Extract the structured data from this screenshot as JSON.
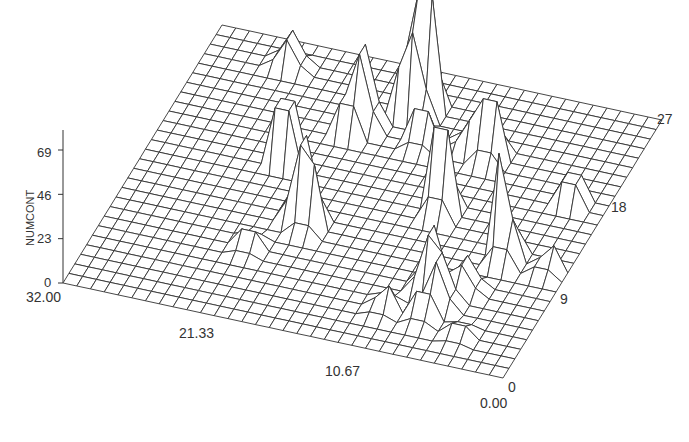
{
  "chart_data": {
    "type": "surface3d",
    "title": "",
    "zlabel": "NUMCONT",
    "z_ticks": [
      "0",
      "23",
      "46",
      "69"
    ],
    "y_ticks": [
      "32.00",
      "21.33",
      "10.67",
      "0.00"
    ],
    "x_ticks": [
      "0",
      "9",
      "18",
      "27"
    ],
    "zlim": [
      0,
      69
    ],
    "ylim": [
      0,
      32
    ],
    "xlim": [
      0,
      27
    ],
    "grid": {
      "nu": 32,
      "nv": 27
    },
    "peaks": [
      {
        "u": 16.5,
        "v": 23.0,
        "z": 105
      },
      {
        "u": 15.8,
        "v": 22.5,
        "z": 78
      },
      {
        "u": 13.0,
        "v": 20.5,
        "z": 68
      },
      {
        "u": 12.5,
        "v": 19.5,
        "z": 30
      },
      {
        "u": 21.5,
        "v": 14.0,
        "z": 75
      },
      {
        "u": 22.5,
        "v": 20.0,
        "z": 52
      },
      {
        "u": 21.0,
        "v": 20.5,
        "z": 30
      },
      {
        "u": 17.5,
        "v": 20.0,
        "z": 30
      },
      {
        "u": 6.0,
        "v": 24.5,
        "z": 28
      },
      {
        "u": 9.5,
        "v": 15.5,
        "z": 52
      },
      {
        "u": 13.0,
        "v": 10.5,
        "z": 72
      },
      {
        "u": 13.8,
        "v": 10.0,
        "z": 40
      },
      {
        "u": 10.5,
        "v": 7.0,
        "z": 15
      },
      {
        "u": 27.2,
        "v": 11.0,
        "z": 65
      },
      {
        "u": 24.0,
        "v": 6.5,
        "z": 55
      },
      {
        "u": 25.0,
        "v": 5.5,
        "z": 42
      },
      {
        "u": 24.5,
        "v": 4.0,
        "z": 22
      },
      {
        "u": 26.0,
        "v": 7.5,
        "z": 25
      },
      {
        "u": 29.5,
        "v": 17.5,
        "z": 22
      },
      {
        "u": 30.8,
        "v": 10.8,
        "z": 15
      },
      {
        "u": 21.8,
        "v": 4.0,
        "z": 15
      },
      {
        "u": 27.5,
        "v": 3.0,
        "z": 10
      }
    ]
  },
  "axes": {
    "z_title": "NUMCONT"
  }
}
